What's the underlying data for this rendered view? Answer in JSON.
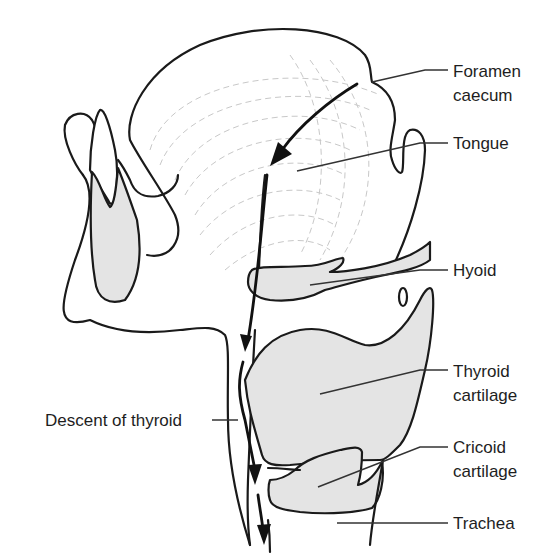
{
  "figure": {
    "labels": {
      "foramen_caecum_line1": "Foramen",
      "foramen_caecum_line2": "caecum",
      "tongue": "Tongue",
      "hyoid": "Hyoid",
      "thyroid_cartilage_line1": "Thyroid",
      "thyroid_cartilage_line2": "cartilage",
      "cricoid_cartilage_line1": "Cricoid",
      "cricoid_cartilage_line2": "cartilage",
      "trachea": "Trachea",
      "descent_of_thyroid": "Descent of thyroid"
    },
    "colors": {
      "outline": "#1a1a1a",
      "cartilage_fill": "#e4e4e4",
      "background": "#ffffff"
    }
  }
}
